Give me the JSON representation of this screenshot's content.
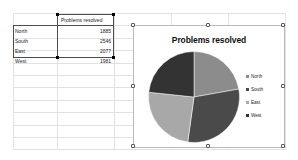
{
  "spreadsheet": {
    "table": {
      "header_label": "Problems resolved",
      "rows": [
        {
          "label": "North",
          "value": "1885"
        },
        {
          "label": "South",
          "value": "2546"
        },
        {
          "label": "East",
          "value": "2077"
        },
        {
          "label": "West",
          "value": "1981"
        }
      ]
    }
  },
  "chart_object": {
    "title": "Problems resolved",
    "legend": [
      {
        "label": "North",
        "color": "#8c8c8c"
      },
      {
        "label": "South",
        "color": "#4a4a4a"
      },
      {
        "label": "East",
        "color": "#a8a8a8"
      },
      {
        "label": "West",
        "color": "#333333"
      }
    ]
  },
  "chart_data": {
    "type": "pie",
    "title": "Problems resolved",
    "xlabel": "",
    "ylabel": "",
    "categories": [
      "North",
      "South",
      "East",
      "West"
    ],
    "values": [
      1885,
      2546,
      2077,
      1981
    ],
    "total": 8489,
    "percentages": [
      22.2,
      30.0,
      24.5,
      23.3
    ],
    "colors": [
      "#8c8c8c",
      "#4a4a4a",
      "#a8a8a8",
      "#333333"
    ],
    "legend_position": "right",
    "grid": false,
    "start_angle_deg": 0,
    "direction": "clockwise"
  }
}
